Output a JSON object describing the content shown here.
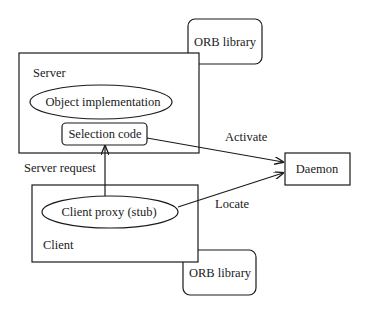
{
  "diagram": {
    "nodes": {
      "orb_library_top": {
        "label": "ORB library"
      },
      "server": {
        "label": "Server"
      },
      "object_implementation": {
        "label": "Object implementation"
      },
      "selection_code": {
        "label": "Selection code"
      },
      "daemon": {
        "label": "Daemon"
      },
      "client_proxy": {
        "label": "Client proxy (stub)"
      },
      "client": {
        "label": "Client"
      },
      "orb_library_bottom": {
        "label": "ORB library"
      }
    },
    "edges": {
      "server_request": {
        "label": "Server request",
        "from": "Client proxy (stub)",
        "to": "Selection code"
      },
      "activate": {
        "label": "Activate",
        "from": "Selection code",
        "to": "Daemon"
      },
      "locate": {
        "label": "Locate",
        "from": "Client proxy (stub)",
        "to": "Daemon"
      }
    }
  }
}
